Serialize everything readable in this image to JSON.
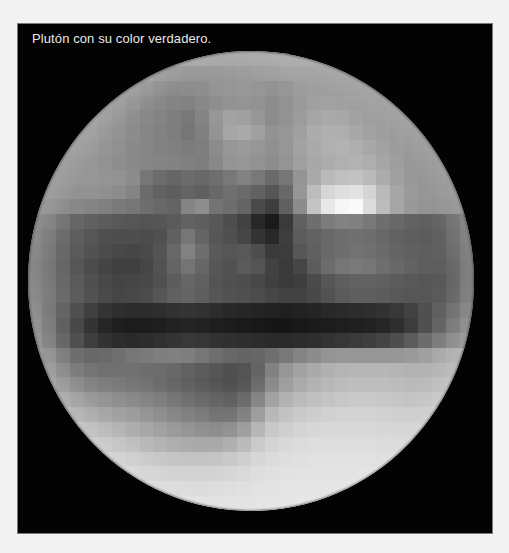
{
  "caption": "Plutón con su color verdadero.",
  "colors": {
    "page_background": "#f3f3f3",
    "panel_background": "#030303",
    "caption_text": "#e8e8e8"
  },
  "planet": {
    "name": "Plutón",
    "grid_cols": 32,
    "grid_rows": 31,
    "tone_rows": [
      [
        150,
        152,
        155,
        158,
        160,
        162,
        164,
        165,
        166,
        166,
        165,
        164,
        163,
        162,
        162,
        163,
        164,
        165,
        166,
        166,
        165,
        164,
        163,
        162,
        160,
        158,
        156,
        155,
        154,
        153,
        152,
        150
      ],
      [
        152,
        154,
        157,
        160,
        162,
        160,
        158,
        156,
        155,
        150,
        148,
        146,
        148,
        150,
        152,
        154,
        156,
        158,
        160,
        160,
        159,
        158,
        157,
        156,
        155,
        154,
        153,
        152,
        151,
        150,
        150,
        150
      ],
      [
        152,
        154,
        158,
        160,
        160,
        156,
        152,
        150,
        146,
        140,
        138,
        140,
        142,
        148,
        150,
        152,
        150,
        146,
        150,
        156,
        158,
        158,
        157,
        156,
        155,
        154,
        153,
        152,
        151,
        150,
        150,
        150
      ],
      [
        150,
        153,
        157,
        158,
        158,
        154,
        150,
        146,
        140,
        136,
        132,
        130,
        136,
        142,
        146,
        148,
        146,
        140,
        146,
        154,
        160,
        162,
        160,
        158,
        156,
        154,
        153,
        152,
        151,
        150,
        150,
        150
      ],
      [
        150,
        152,
        156,
        156,
        156,
        152,
        148,
        142,
        136,
        132,
        126,
        120,
        132,
        150,
        162,
        160,
        150,
        140,
        146,
        156,
        166,
        170,
        168,
        162,
        158,
        156,
        154,
        152,
        151,
        150,
        150,
        150
      ],
      [
        148,
        150,
        154,
        154,
        154,
        150,
        146,
        140,
        134,
        130,
        126,
        118,
        128,
        148,
        166,
        170,
        160,
        146,
        150,
        160,
        172,
        176,
        174,
        168,
        162,
        158,
        154,
        152,
        150,
        149,
        148,
        148
      ],
      [
        146,
        148,
        152,
        152,
        152,
        148,
        144,
        138,
        134,
        130,
        128,
        124,
        126,
        140,
        150,
        154,
        150,
        144,
        150,
        162,
        170,
        176,
        178,
        174,
        168,
        162,
        156,
        152,
        150,
        148,
        146,
        146
      ],
      [
        144,
        146,
        150,
        150,
        150,
        146,
        142,
        138,
        134,
        132,
        130,
        128,
        126,
        136,
        148,
        150,
        146,
        140,
        148,
        160,
        168,
        172,
        176,
        178,
        174,
        166,
        158,
        152,
        150,
        148,
        146,
        144
      ],
      [
        146,
        148,
        150,
        150,
        150,
        148,
        146,
        140,
        118,
        108,
        102,
        108,
        104,
        110,
        120,
        130,
        120,
        106,
        118,
        148,
        170,
        186,
        192,
        194,
        186,
        172,
        160,
        152,
        150,
        148,
        146,
        146
      ],
      [
        146,
        148,
        148,
        146,
        146,
        144,
        140,
        132,
        108,
        98,
        94,
        100,
        96,
        104,
        112,
        106,
        98,
        86,
        104,
        150,
        188,
        214,
        222,
        226,
        212,
        186,
        166,
        154,
        150,
        148,
        146,
        146
      ],
      [
        140,
        142,
        140,
        136,
        132,
        128,
        122,
        118,
        110,
        104,
        100,
        132,
        142,
        116,
        110,
        100,
        74,
        62,
        96,
        140,
        196,
        232,
        246,
        250,
        220,
        188,
        166,
        152,
        148,
        146,
        144,
        142
      ],
      [
        128,
        126,
        116,
        102,
        96,
        92,
        88,
        86,
        84,
        86,
        90,
        98,
        94,
        88,
        78,
        66,
        40,
        26,
        58,
        96,
        110,
        124,
        130,
        128,
        120,
        110,
        104,
        98,
        96,
        100,
        108,
        120
      ],
      [
        126,
        120,
        108,
        94,
        86,
        80,
        78,
        78,
        76,
        80,
        96,
        118,
        100,
        86,
        80,
        70,
        52,
        40,
        62,
        92,
        98,
        104,
        110,
        112,
        110,
        104,
        98,
        94,
        92,
        96,
        106,
        118
      ],
      [
        124,
        118,
        104,
        90,
        82,
        76,
        72,
        70,
        74,
        84,
        104,
        130,
        110,
        90,
        86,
        88,
        78,
        58,
        60,
        86,
        96,
        104,
        110,
        114,
        112,
        106,
        100,
        96,
        94,
        96,
        104,
        116
      ],
      [
        122,
        116,
        102,
        86,
        76,
        68,
        64,
        64,
        70,
        82,
        100,
        116,
        102,
        86,
        82,
        90,
        84,
        66,
        58,
        70,
        92,
        108,
        118,
        122,
        118,
        110,
        104,
        98,
        94,
        94,
        100,
        114
      ],
      [
        124,
        118,
        104,
        90,
        80,
        72,
        68,
        70,
        72,
        80,
        92,
        102,
        96,
        84,
        80,
        78,
        72,
        64,
        58,
        62,
        74,
        86,
        94,
        98,
        98,
        96,
        92,
        88,
        86,
        88,
        98,
        114
      ],
      [
        126,
        120,
        106,
        92,
        82,
        74,
        70,
        72,
        76,
        86,
        96,
        100,
        94,
        86,
        82,
        80,
        76,
        70,
        66,
        66,
        72,
        82,
        90,
        94,
        94,
        92,
        88,
        86,
        86,
        90,
        100,
        116
      ],
      [
        130,
        118,
        100,
        80,
        64,
        52,
        46,
        44,
        44,
        46,
        50,
        52,
        50,
        44,
        40,
        38,
        36,
        34,
        32,
        34,
        36,
        40,
        42,
        44,
        46,
        50,
        56,
        66,
        80,
        96,
        110,
        124
      ],
      [
        134,
        120,
        96,
        72,
        52,
        38,
        30,
        28,
        28,
        30,
        34,
        36,
        34,
        30,
        28,
        26,
        24,
        22,
        22,
        24,
        26,
        28,
        30,
        32,
        34,
        38,
        46,
        60,
        80,
        100,
        118,
        132
      ],
      [
        138,
        124,
        102,
        80,
        62,
        50,
        44,
        42,
        44,
        48,
        52,
        56,
        54,
        50,
        48,
        46,
        44,
        42,
        42,
        44,
        46,
        50,
        54,
        58,
        62,
        68,
        78,
        92,
        108,
        124,
        136,
        146
      ],
      [
        150,
        140,
        124,
        110,
        104,
        106,
        112,
        118,
        122,
        126,
        128,
        126,
        118,
        110,
        104,
        100,
        102,
        110,
        120,
        132,
        140,
        148,
        150,
        150,
        150,
        150,
        150,
        154,
        160,
        168,
        172,
        176
      ],
      [
        156,
        148,
        136,
        124,
        116,
        112,
        112,
        112,
        110,
        108,
        104,
        98,
        92,
        86,
        80,
        84,
        100,
        130,
        150,
        162,
        170,
        176,
        180,
        182,
        182,
        182,
        180,
        178,
        178,
        180,
        182,
        186
      ],
      [
        162,
        156,
        146,
        136,
        128,
        122,
        118,
        114,
        110,
        104,
        98,
        92,
        86,
        80,
        76,
        82,
        104,
        136,
        156,
        168,
        176,
        182,
        186,
        188,
        188,
        188,
        186,
        184,
        184,
        186,
        188,
        192
      ],
      [
        172,
        168,
        160,
        152,
        146,
        140,
        134,
        128,
        122,
        116,
        108,
        100,
        94,
        88,
        84,
        96,
        124,
        156,
        172,
        182,
        188,
        192,
        196,
        198,
        198,
        196,
        194,
        192,
        192,
        194,
        196,
        200
      ],
      [
        184,
        180,
        174,
        168,
        162,
        156,
        150,
        144,
        136,
        128,
        120,
        112,
        106,
        98,
        98,
        114,
        146,
        176,
        188,
        196,
        200,
        204,
        206,
        206,
        206,
        204,
        202,
        200,
        200,
        202,
        204,
        206
      ],
      [
        194,
        192,
        188,
        184,
        180,
        174,
        168,
        160,
        152,
        144,
        136,
        130,
        124,
        120,
        126,
        142,
        170,
        192,
        200,
        206,
        210,
        212,
        212,
        212,
        212,
        210,
        208,
        206,
        206,
        208,
        210,
        212
      ],
      [
        202,
        200,
        198,
        196,
        192,
        188,
        184,
        178,
        170,
        162,
        156,
        152,
        150,
        150,
        158,
        172,
        192,
        204,
        210,
        214,
        216,
        216,
        216,
        216,
        216,
        214,
        212,
        212,
        212,
        212,
        214,
        216
      ],
      [
        210,
        208,
        206,
        204,
        202,
        200,
        198,
        194,
        190,
        186,
        182,
        180,
        180,
        182,
        188,
        196,
        206,
        212,
        216,
        218,
        220,
        220,
        220,
        220,
        218,
        218,
        216,
        216,
        216,
        216,
        218,
        218
      ],
      [
        216,
        214,
        212,
        210,
        210,
        208,
        206,
        204,
        202,
        200,
        198,
        198,
        198,
        200,
        204,
        208,
        214,
        218,
        220,
        222,
        222,
        222,
        222,
        222,
        222,
        220,
        220,
        220,
        220,
        220,
        220,
        220
      ],
      [
        220,
        218,
        218,
        216,
        216,
        214,
        214,
        212,
        212,
        210,
        210,
        210,
        210,
        212,
        214,
        216,
        220,
        222,
        224,
        224,
        224,
        224,
        224,
        224,
        224,
        222,
        222,
        222,
        222,
        222,
        222,
        222
      ],
      [
        222,
        222,
        220,
        220,
        220,
        220,
        218,
        218,
        218,
        218,
        218,
        218,
        218,
        218,
        220,
        220,
        222,
        224,
        224,
        226,
        226,
        226,
        226,
        226,
        224,
        224,
        224,
        224,
        224,
        224,
        224,
        224
      ]
    ]
  }
}
